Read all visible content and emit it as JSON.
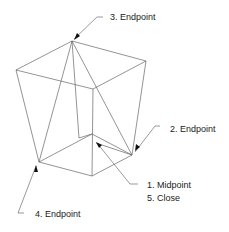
{
  "diagram": {
    "labels": [
      {
        "id": "endpoint-3",
        "text": "3. Endpoint",
        "x": 110,
        "y": 12
      },
      {
        "id": "endpoint-2",
        "text": "2. Endpoint",
        "x": 170,
        "y": 124
      },
      {
        "id": "midpoint-1",
        "text": "1. Midpoint",
        "x": 147,
        "y": 180
      },
      {
        "id": "close-5",
        "text": "5. Close",
        "x": 147,
        "y": 193
      },
      {
        "id": "endpoint-4",
        "text": "4. Endpoint",
        "x": 35,
        "y": 209
      }
    ],
    "line_color": "#555555",
    "arrow_color": "#111111"
  }
}
